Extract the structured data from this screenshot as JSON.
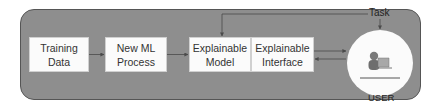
{
  "diagram": {
    "nodes": [
      {
        "id": "training-data",
        "label": "Training\nData"
      },
      {
        "id": "new-ml-process",
        "label": "New ML\nProcess"
      },
      {
        "id": "explainable-model",
        "label": "Explainable\nModel"
      },
      {
        "id": "explainable-interface",
        "label": "Explainable\nInterface"
      }
    ],
    "user": {
      "label": "USER"
    },
    "task": {
      "label": "Task"
    },
    "edges": [
      {
        "from": "training-data",
        "to": "new-ml-process"
      },
      {
        "from": "new-ml-process",
        "to": "explainable-model"
      },
      {
        "from": "explainable-interface",
        "to": "user"
      },
      {
        "from": "user",
        "to": "explainable-interface"
      },
      {
        "from": "task",
        "to": "explainable-model"
      },
      {
        "from": "task",
        "to": "user"
      }
    ],
    "colors": {
      "container": "#8e8e8e",
      "box": "#fbfbfb",
      "arrow": "#4a4a4a"
    }
  }
}
